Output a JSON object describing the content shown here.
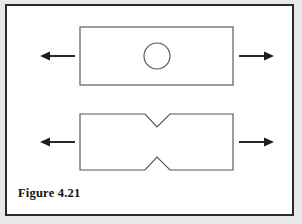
{
  "figure": {
    "caption": "Figure 4.21",
    "border_color": "#2b2b2b",
    "outline_color": "#555555",
    "arrow_color": "#1d1d1d",
    "background_color": "#ffffff"
  },
  "diagram": {
    "type": "engineering-schematic",
    "specimens": [
      {
        "id": "plate-with-circular-hole",
        "label": "plate with central circular hole",
        "shape": "rectangle",
        "rect": {
          "x": 73,
          "y": 21,
          "width": 153,
          "height": 58
        },
        "feature": {
          "kind": "circular-hole",
          "cx": 150,
          "cy": 50,
          "r": 13
        },
        "loads": [
          {
            "id": "left-tension-arrow",
            "direction": "left",
            "x1": 68,
            "y1": 50,
            "x2": 33,
            "y2": 50
          },
          {
            "id": "right-tension-arrow",
            "direction": "right",
            "x1": 232,
            "y1": 50,
            "x2": 267,
            "y2": 50
          }
        ]
      },
      {
        "id": "plate-with-v-notches",
        "label": "plate with opposed V-notches",
        "shape": "notched-rectangle",
        "rect": {
          "x": 73,
          "y": 108,
          "width": 153,
          "height": 56
        },
        "feature": {
          "kind": "double-v-notch",
          "notch_center_x": 150,
          "top_notch_opening": [
            138,
            163
          ],
          "top_notch_apex_y": 121,
          "bottom_notch_opening": [
            138,
            163
          ],
          "bottom_notch_apex_y": 151
        },
        "loads": [
          {
            "id": "left-tension-arrow",
            "direction": "left",
            "x1": 68,
            "y1": 136,
            "x2": 33,
            "y2": 136
          },
          {
            "id": "right-tension-arrow",
            "direction": "right",
            "x1": 232,
            "y1": 136,
            "x2": 267,
            "y2": 136
          }
        ]
      }
    ]
  }
}
